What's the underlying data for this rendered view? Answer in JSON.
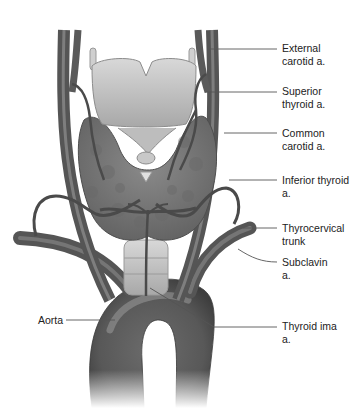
{
  "diagram": {
    "colors": {
      "vessel": "#5e5e5e",
      "vessel_light": "#8f8f8f",
      "gland": "#7a7a7a",
      "cartilage": "#c9c9c9",
      "trachea": "#d4d4d4",
      "leader_line": "#555555",
      "text": "#222222"
    },
    "labels": [
      {
        "id": "external-carotid",
        "line1": "External",
        "line2": "carotid a."
      },
      {
        "id": "superior-thyroid",
        "line1": "Superior",
        "line2": "thyroid a."
      },
      {
        "id": "common-carotid",
        "line1": "Common",
        "line2": "carotid a."
      },
      {
        "id": "inferior-thyroid",
        "line1": "Inferior thyroid",
        "line2": "a."
      },
      {
        "id": "thyrocervical-trunk",
        "line1": "Thyrocervical",
        "line2": "trunk"
      },
      {
        "id": "subclavian",
        "line1": "Subclavin",
        "line2": "a."
      },
      {
        "id": "thyroid-ima",
        "line1": "Thyroid ima",
        "line2": "a."
      },
      {
        "id": "aorta",
        "line1": "Aorta",
        "line2": ""
      }
    ]
  }
}
